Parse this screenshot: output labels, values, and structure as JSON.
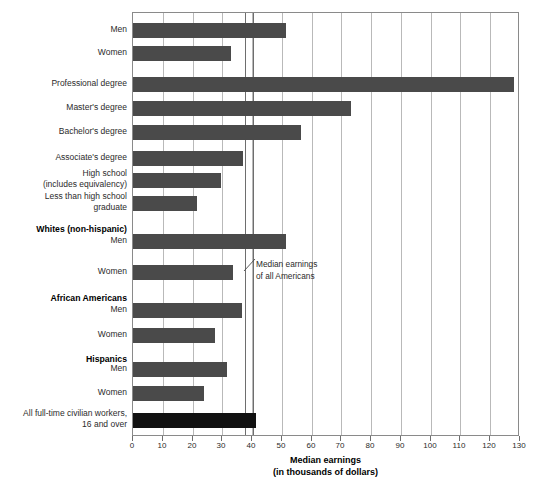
{
  "chart_data": {
    "type": "bar",
    "orientation": "horizontal",
    "title": "",
    "xlabel": "Median earnings\n(in thousands of dollars)",
    "ylabel": "",
    "xlim": [
      0,
      130
    ],
    "xticks": [
      0,
      10,
      20,
      30,
      40,
      50,
      60,
      70,
      80,
      90,
      100,
      110,
      120,
      130
    ],
    "xtick_labels": [
      "0",
      "10",
      "20",
      "30",
      "40",
      "50",
      "60",
      "70",
      "80",
      "90",
      "100",
      "110",
      "120",
      "130"
    ],
    "grid": true,
    "legend": "none",
    "reference_lines": [
      {
        "value": 37.6,
        "label": "Median earnings of all Americans"
      },
      {
        "value": 40.3,
        "label": ""
      }
    ],
    "annotations": [
      {
        "text": "Median earnings\nof all Americans",
        "x": 41.5,
        "y_row": 9
      }
    ],
    "categories": [
      "Men",
      "Women",
      "Professional degree",
      "Master's degree",
      "Bachelor's degree",
      "Associate's degree",
      "High school\n(includes equivalency)",
      "Less than high school\ngraduate",
      "Whites (non-hispanic)",
      "Men",
      "Women",
      "African Americans",
      "Men",
      "Women",
      "Hispanics",
      "Men",
      "Women",
      "All full-time civilian workers,\n16 and over"
    ],
    "values": [
      51.4,
      33.0,
      128.0,
      73.2,
      56.4,
      37.0,
      29.5,
      21.5,
      null,
      51.4,
      33.6,
      null,
      36.6,
      27.5,
      null,
      31.6,
      23.8,
      41.3
    ],
    "series": [
      {
        "name": "Median earnings",
        "values": [
          51.4,
          33.0,
          128.0,
          73.2,
          56.4,
          37.0,
          29.5,
          21.5,
          null,
          51.4,
          33.6,
          null,
          36.6,
          27.5,
          null,
          31.6,
          23.8,
          41.3
        ]
      }
    ],
    "colors": {
      "bar": "#4a4a4a",
      "highlight_bar": "#111111",
      "gridline": "#b9b9b9",
      "reference_line": "#6e6e6e",
      "frame": "#8a8a8a",
      "text": "#2b2b2b"
    }
  },
  "rows": [
    {
      "label": "Men",
      "value": 51.4,
      "kind": "bar",
      "y": 22,
      "label_lines": 1
    },
    {
      "label": "Women",
      "value": 33.0,
      "kind": "bar",
      "y": 45,
      "label_lines": 1
    },
    {
      "label": "Professional degree",
      "value": 128.0,
      "kind": "bar",
      "y": 76,
      "label_lines": 1
    },
    {
      "label": "Master's degree",
      "value": 73.2,
      "kind": "bar",
      "y": 100,
      "label_lines": 1
    },
    {
      "label": "Bachelor's degree",
      "value": 56.4,
      "kind": "bar",
      "y": 124,
      "label_lines": 1
    },
    {
      "label": "Associate's degree",
      "value": 37.0,
      "kind": "bar",
      "y": 150,
      "label_lines": 1
    },
    {
      "label": "High school\n(includes equivalency)",
      "value": 29.5,
      "kind": "bar",
      "y": 172,
      "label_lines": 2
    },
    {
      "label": "Less than high school\ngraduate",
      "value": 21.5,
      "kind": "bar",
      "y": 195,
      "label_lines": 2
    },
    {
      "label": "Whites (non-hispanic)",
      "value": null,
      "kind": "group",
      "y": 222,
      "label_lines": 1
    },
    {
      "label": "Men",
      "value": 51.4,
      "kind": "bar",
      "y": 233,
      "label_lines": 1
    },
    {
      "label": "Women",
      "value": 33.6,
      "kind": "bar",
      "y": 264,
      "label_lines": 1
    },
    {
      "label": "African Americans",
      "value": null,
      "kind": "group",
      "y": 291,
      "label_lines": 1
    },
    {
      "label": "Men",
      "value": 36.6,
      "kind": "bar",
      "y": 302,
      "label_lines": 1
    },
    {
      "label": "Women",
      "value": 27.5,
      "kind": "bar",
      "y": 327,
      "label_lines": 1
    },
    {
      "label": "Hispanics",
      "value": null,
      "kind": "group",
      "y": 352,
      "label_lines": 1
    },
    {
      "label": "Men",
      "value": 31.6,
      "kind": "bar",
      "y": 361,
      "label_lines": 1
    },
    {
      "label": "Women",
      "value": 23.8,
      "kind": "bar",
      "y": 385,
      "label_lines": 1
    },
    {
      "label": "All full-time civilian workers,\n16 and over",
      "value": 41.3,
      "kind": "bar-highlight",
      "y": 412,
      "label_lines": 2
    }
  ],
  "axis": {
    "title_line1": "Median earnings",
    "title_line2": "(in thousands of dollars)"
  },
  "annotation": {
    "text": "Median earnings\nof all Americans"
  }
}
